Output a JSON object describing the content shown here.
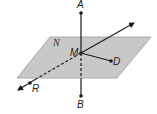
{
  "diagram": {
    "plane": {
      "label": "N",
      "fill": "#c8c8c8",
      "stroke": "#9a9a9a"
    },
    "points": {
      "A": "A",
      "B": "B",
      "M": "M",
      "D": "D",
      "R": "R"
    },
    "line_color": "#1a1a1a"
  }
}
